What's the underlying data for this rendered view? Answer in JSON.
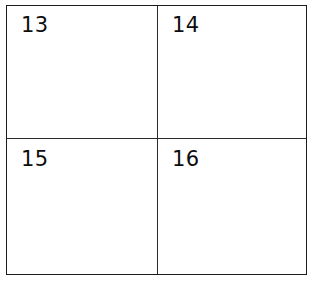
{
  "figure": {
    "name": "four-quadrant-grid",
    "background_color": "#ffffff",
    "border_color": "#1c1c1c",
    "divider_color": "#2a2a2a",
    "label_color": "#0d0d0d"
  },
  "cells": [
    {
      "position": "top-left",
      "label": "13"
    },
    {
      "position": "top-right",
      "label": "14"
    },
    {
      "position": "bottom-left",
      "label": "15"
    },
    {
      "position": "bottom-right",
      "label": "16"
    }
  ]
}
